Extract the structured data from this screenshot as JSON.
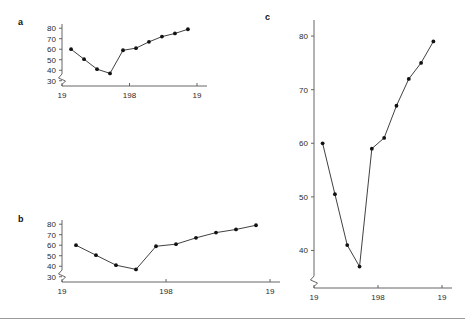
{
  "figure": {
    "background": "#ffffff",
    "line_color": "#2b2b2b",
    "dot_color": "#111111",
    "axis_color": "#555555",
    "rule_color": "#9a9a9a",
    "footer_rule_y": 318
  },
  "panels": [
    {
      "id": "a",
      "letter": "a",
      "letter_x": 18,
      "letter_y": 18,
      "box": {
        "left": 40,
        "top": 10,
        "width": 160,
        "height": 100
      },
      "plot": {
        "x": 22,
        "y": 14,
        "w": 135,
        "h": 62
      },
      "y_ticks": [
        "30",
        "40",
        "50",
        "60",
        "70",
        "80"
      ],
      "x_ticks": [
        "19",
        "198",
        "19"
      ],
      "x_tick_positions": [
        0,
        0.5,
        1.0
      ]
    },
    {
      "id": "b",
      "letter": "b",
      "letter_x": 18,
      "letter_y": 215,
      "box": {
        "left": 40,
        "top": 208,
        "width": 232,
        "height": 100
      },
      "plot": {
        "x": 22,
        "y": 12,
        "w": 208,
        "h": 62
      },
      "y_ticks": [
        "30",
        "40",
        "50",
        "60",
        "70",
        "80"
      ],
      "x_ticks": [
        "19",
        "198",
        "19"
      ],
      "x_tick_positions": [
        0,
        0.5,
        1.0
      ]
    },
    {
      "id": "c",
      "letter": "c",
      "letter_x": 265,
      "letter_y": 13,
      "box": {
        "left": 288,
        "top": 8,
        "width": 172,
        "height": 302
      },
      "plot": {
        "x": 26,
        "y": 12,
        "w": 128,
        "h": 268
      },
      "y_ticks": [
        "40",
        "50",
        "60",
        "70",
        "80"
      ],
      "x_ticks": [
        "19",
        "198",
        "19"
      ],
      "x_tick_positions": [
        0,
        0.5,
        1.0
      ]
    }
  ],
  "chart_data": {
    "type": "line",
    "title": "",
    "xlabel": "",
    "ylabel": "",
    "x": [
      1,
      2,
      3,
      4,
      5,
      6,
      7,
      8,
      9,
      10
    ],
    "x_tick_labels": [
      "19",
      "198",
      "19"
    ],
    "series": [
      {
        "name": "series-1",
        "values": [
          60,
          50.5,
          41,
          37,
          59,
          61,
          67,
          72,
          75,
          79
        ]
      }
    ],
    "panel_axes": [
      {
        "panel": "a",
        "ylim": [
          25,
          84
        ],
        "yticks": [
          30,
          40,
          50,
          60,
          70,
          80
        ],
        "xlim": [
          0.3,
          10.7
        ],
        "grid": false,
        "axis_break_y": true
      },
      {
        "panel": "b",
        "ylim": [
          25,
          84
        ],
        "yticks": [
          30,
          40,
          50,
          60,
          70,
          80
        ],
        "xlim": [
          0.3,
          10.7
        ],
        "grid": false,
        "axis_break_y": true
      },
      {
        "panel": "c",
        "ylim": [
          33,
          83
        ],
        "yticks": [
          40,
          50,
          60,
          70,
          80
        ],
        "xlim": [
          0.3,
          10.7
        ],
        "grid": false,
        "axis_break_y": true
      }
    ],
    "legend": [],
    "marker": "filled-circle"
  }
}
